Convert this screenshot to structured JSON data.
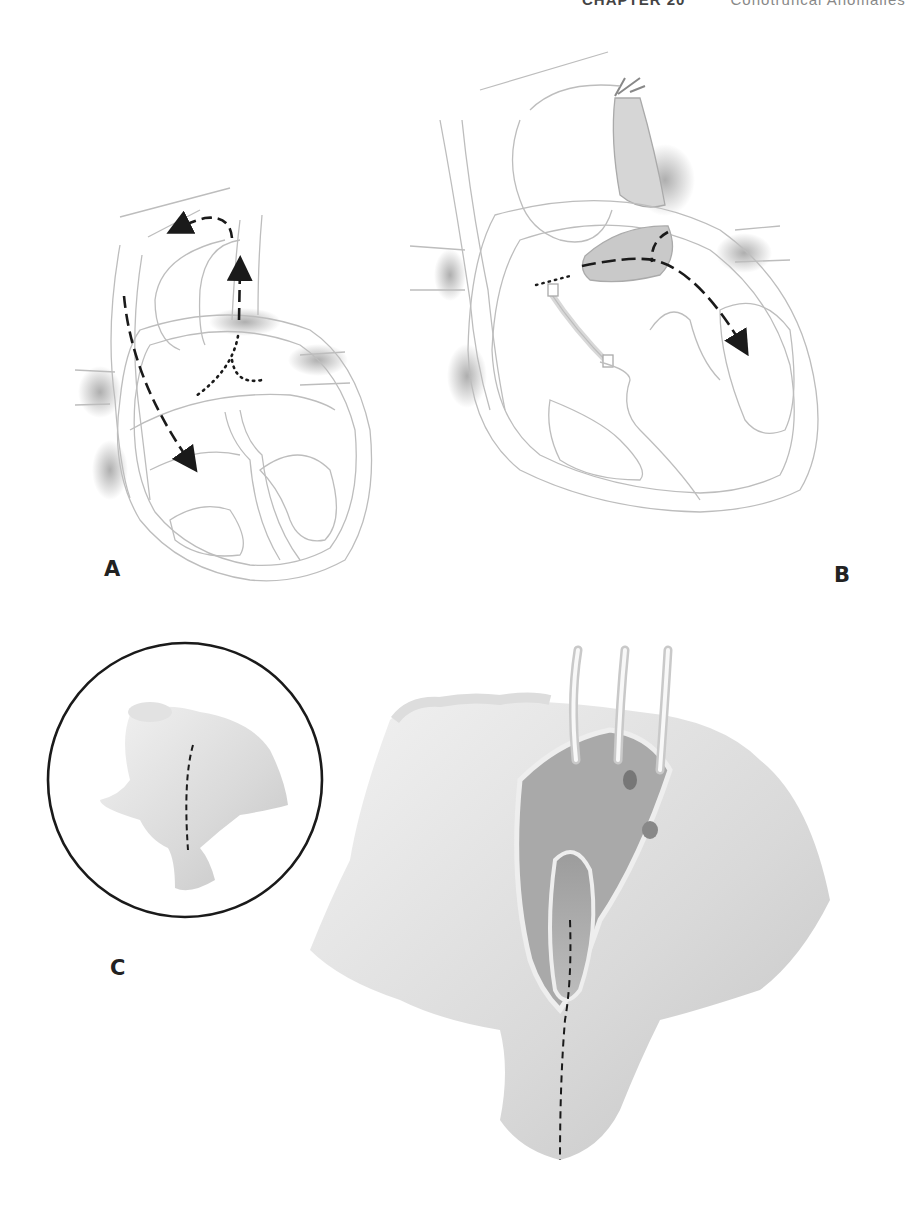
{
  "page": {
    "running_head": {
      "chapter": "CHAPTER 20",
      "title": "Conotruncal Anomalies"
    }
  },
  "figure": {
    "panels": [
      {
        "label": "A",
        "description": "Heart diagram with dashed flow arrows and dotted incision line"
      },
      {
        "label": "B",
        "description": "Heart diagram with ligated vessel, oval defect, and dashed flow arrow into ventricle"
      },
      {
        "label": "C",
        "description": "Inset circle showing conduit with dashed incision line, and opened surgical view with retractors"
      }
    ]
  },
  "colors": {
    "ink": "#222222",
    "outline": "#b8b8b8",
    "shade": "#9a9a9a",
    "paper": "#ffffff"
  }
}
